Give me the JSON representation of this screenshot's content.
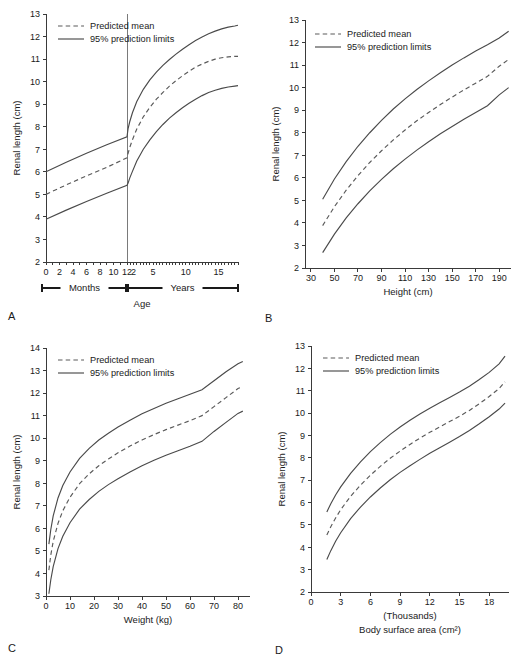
{
  "figure": {
    "legend": {
      "predicted_mean": "Predicted mean",
      "prediction_limits": "95% prediction limits"
    },
    "ylabel": "Renal length (cm)"
  },
  "chart_data": [
    {
      "id": "A",
      "panel_letter": "A",
      "type": "line",
      "title": "",
      "xlabel": "Age",
      "ylabel": "Renal length (cm)",
      "ylim": [
        2,
        13
      ],
      "yticks": [
        2,
        3,
        4,
        5,
        6,
        7,
        8,
        9,
        10,
        11,
        12,
        13
      ],
      "x_axis_note": "Split axis: months 0-12 then years 2-18",
      "axis_segments": [
        {
          "label": "Months",
          "ticks": [
            0,
            2,
            4,
            6,
            8,
            10,
            12
          ],
          "tick_labels": [
            "0",
            "2",
            "4",
            "6",
            "8",
            "10",
            "12"
          ]
        },
        {
          "label": "Years",
          "ticks": [
            2,
            5,
            10,
            15
          ],
          "tick_labels": [
            "2",
            "5",
            "10",
            "15"
          ]
        }
      ],
      "grid": false,
      "legend_position": "top-left",
      "series": [
        {
          "name": "95% upper prediction limit",
          "style": "solid",
          "x": [
            0,
            3,
            6,
            9,
            12,
            14,
            17,
            22,
            30,
            42,
            54,
            66,
            78,
            90,
            102,
            114,
            126,
            138,
            150,
            162,
            174,
            186,
            198,
            210,
            216
          ],
          "y": [
            6.0,
            6.42,
            6.82,
            7.2,
            7.55,
            7.92,
            8.22,
            8.62,
            9.12,
            9.66,
            10.08,
            10.42,
            10.72,
            10.98,
            11.22,
            11.44,
            11.64,
            11.82,
            11.98,
            12.12,
            12.24,
            12.34,
            12.42,
            12.47,
            12.5
          ]
        },
        {
          "name": "Predicted mean",
          "style": "dashed",
          "x": [
            0,
            3,
            6,
            9,
            12,
            14,
            17,
            22,
            30,
            42,
            54,
            66,
            78,
            90,
            102,
            114,
            126,
            138,
            150,
            162,
            174,
            186,
            198,
            210,
            216
          ],
          "y": [
            5.0,
            5.42,
            5.82,
            6.2,
            6.62,
            6.82,
            7.08,
            7.42,
            7.9,
            8.44,
            8.86,
            9.22,
            9.52,
            9.8,
            10.04,
            10.26,
            10.46,
            10.64,
            10.78,
            10.9,
            11.0,
            11.06,
            11.1,
            11.12,
            11.12
          ]
        },
        {
          "name": "95% lower prediction limit",
          "style": "solid",
          "x": [
            0,
            3,
            6,
            9,
            12,
            14,
            17,
            22,
            30,
            42,
            54,
            66,
            78,
            90,
            102,
            114,
            126,
            138,
            150,
            162,
            174,
            186,
            198,
            210,
            216
          ],
          "y": [
            3.9,
            4.3,
            4.68,
            5.05,
            5.4,
            5.5,
            5.72,
            6.02,
            6.48,
            7.0,
            7.42,
            7.78,
            8.1,
            8.38,
            8.62,
            8.84,
            9.04,
            9.22,
            9.38,
            9.52,
            9.62,
            9.7,
            9.76,
            9.8,
            9.82
          ]
        }
      ]
    },
    {
      "id": "B",
      "panel_letter": "B",
      "type": "line",
      "title": "",
      "xlabel": "Height (cm)",
      "ylabel": "Renal length (cm)",
      "xlim": [
        25,
        200
      ],
      "ylim": [
        2,
        13
      ],
      "xticks": [
        30,
        50,
        70,
        90,
        110,
        130,
        150,
        170,
        190
      ],
      "yticks": [
        2,
        3,
        4,
        5,
        6,
        7,
        8,
        9,
        10,
        11,
        12,
        13
      ],
      "grid": false,
      "legend_position": "top-left",
      "series": [
        {
          "name": "95% upper prediction limit",
          "style": "solid",
          "x": [
            40,
            50,
            60,
            70,
            80,
            90,
            100,
            110,
            120,
            130,
            140,
            150,
            160,
            170,
            180,
            190,
            198
          ],
          "y": [
            5.05,
            5.95,
            6.72,
            7.4,
            8.0,
            8.55,
            9.05,
            9.5,
            9.92,
            10.3,
            10.66,
            11.0,
            11.32,
            11.62,
            11.9,
            12.2,
            12.5
          ]
        },
        {
          "name": "Predicted mean",
          "style": "dashed",
          "x": [
            40,
            50,
            60,
            70,
            80,
            90,
            100,
            110,
            120,
            130,
            140,
            150,
            160,
            170,
            180,
            190,
            198
          ],
          "y": [
            3.88,
            4.72,
            5.45,
            6.1,
            6.68,
            7.2,
            7.68,
            8.12,
            8.53,
            8.9,
            9.25,
            9.58,
            9.9,
            10.2,
            10.5,
            10.95,
            11.25
          ]
        },
        {
          "name": "95% lower prediction limit",
          "style": "solid",
          "x": [
            40,
            50,
            60,
            70,
            80,
            90,
            100,
            110,
            120,
            130,
            140,
            150,
            160,
            170,
            180,
            190,
            198
          ],
          "y": [
            2.68,
            3.5,
            4.22,
            4.85,
            5.42,
            5.93,
            6.4,
            6.83,
            7.23,
            7.6,
            7.95,
            8.28,
            8.6,
            8.9,
            9.2,
            9.68,
            10.0
          ]
        }
      ]
    },
    {
      "id": "C",
      "panel_letter": "C",
      "type": "line",
      "title": "",
      "xlabel": "Weight (kg)",
      "ylabel": "Renal length (cm)",
      "xlim": [
        0,
        85
      ],
      "ylim": [
        3,
        14
      ],
      "xticks": [
        0,
        10,
        20,
        30,
        40,
        50,
        60,
        70,
        80
      ],
      "yticks": [
        3,
        4,
        5,
        6,
        7,
        8,
        9,
        10,
        11,
        12,
        13,
        14
      ],
      "grid": false,
      "legend_position": "top-left",
      "series": [
        {
          "name": "95% upper prediction limit",
          "style": "solid",
          "x": [
            1.2,
            2,
            3,
            5,
            7,
            10,
            14,
            18,
            22,
            26,
            30,
            35,
            40,
            45,
            50,
            55,
            60,
            65,
            70,
            75,
            80,
            82
          ],
          "y": [
            5.3,
            5.95,
            6.55,
            7.35,
            7.9,
            8.5,
            9.1,
            9.55,
            9.92,
            10.22,
            10.5,
            10.8,
            11.08,
            11.32,
            11.55,
            11.75,
            11.95,
            12.15,
            12.55,
            12.95,
            13.3,
            13.4
          ]
        },
        {
          "name": "Predicted mean",
          "style": "dashed",
          "x": [
            1.2,
            2,
            3,
            5,
            7,
            10,
            14,
            18,
            22,
            26,
            30,
            35,
            40,
            45,
            50,
            55,
            60,
            65,
            70,
            75,
            80,
            82
          ],
          "y": [
            4.15,
            4.82,
            5.42,
            6.22,
            6.78,
            7.38,
            7.98,
            8.42,
            8.78,
            9.08,
            9.35,
            9.65,
            9.92,
            10.16,
            10.38,
            10.58,
            10.78,
            11.0,
            11.4,
            11.8,
            12.2,
            12.3
          ]
        },
        {
          "name": "95% lower prediction limit",
          "style": "solid",
          "x": [
            1.2,
            2,
            3,
            5,
            7,
            10,
            14,
            18,
            22,
            26,
            30,
            35,
            40,
            45,
            50,
            55,
            60,
            65,
            70,
            75,
            80,
            82
          ],
          "y": [
            3.1,
            3.72,
            4.3,
            5.1,
            5.65,
            6.25,
            6.85,
            7.28,
            7.64,
            7.94,
            8.2,
            8.5,
            8.78,
            9.02,
            9.24,
            9.44,
            9.64,
            9.86,
            10.3,
            10.7,
            11.1,
            11.2
          ]
        }
      ]
    },
    {
      "id": "D",
      "panel_letter": "D",
      "type": "line",
      "title": "",
      "xlabel": "Body surface area (cm²)",
      "xlabel_note": "(Thousands)",
      "ylabel": "Renal length (cm)",
      "xlim": [
        0,
        20
      ],
      "ylim": [
        2,
        13
      ],
      "xticks": [
        0,
        3,
        6,
        9,
        12,
        15,
        18
      ],
      "yticks": [
        2,
        3,
        4,
        5,
        6,
        7,
        8,
        9,
        10,
        11,
        12,
        13
      ],
      "grid": false,
      "legend_position": "top-left",
      "series": [
        {
          "name": "95% upper prediction limit",
          "style": "solid",
          "x": [
            1.6,
            2,
            2.5,
            3,
            4,
            5,
            6,
            7,
            8,
            9,
            10,
            11,
            12,
            13,
            14,
            15,
            16,
            17,
            18,
            19,
            19.6
          ],
          "y": [
            5.58,
            5.95,
            6.35,
            6.7,
            7.3,
            7.82,
            8.28,
            8.68,
            9.05,
            9.38,
            9.68,
            9.96,
            10.22,
            10.46,
            10.7,
            10.94,
            11.2,
            11.5,
            11.82,
            12.2,
            12.55
          ]
        },
        {
          "name": "Predicted mean",
          "style": "dashed",
          "x": [
            1.6,
            2,
            2.5,
            3,
            4,
            5,
            6,
            7,
            8,
            9,
            10,
            11,
            12,
            13,
            14,
            15,
            16,
            17,
            18,
            19,
            19.6
          ],
          "y": [
            4.55,
            4.92,
            5.32,
            5.68,
            6.28,
            6.78,
            7.22,
            7.62,
            7.98,
            8.3,
            8.6,
            8.88,
            9.14,
            9.38,
            9.62,
            9.86,
            10.12,
            10.42,
            10.74,
            11.1,
            11.4
          ]
        },
        {
          "name": "95% lower prediction limit",
          "style": "solid",
          "x": [
            1.6,
            2,
            2.5,
            3,
            4,
            5,
            6,
            7,
            8,
            9,
            10,
            11,
            12,
            13,
            14,
            15,
            16,
            17,
            18,
            19,
            19.6
          ],
          "y": [
            3.45,
            3.85,
            4.28,
            4.65,
            5.28,
            5.8,
            6.25,
            6.65,
            7.02,
            7.35,
            7.65,
            7.93,
            8.2,
            8.45,
            8.7,
            8.95,
            9.22,
            9.52,
            9.84,
            10.18,
            10.45
          ]
        }
      ]
    }
  ]
}
